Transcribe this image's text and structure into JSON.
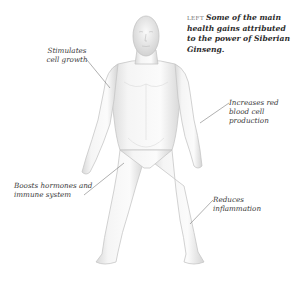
{
  "caption": {
    "lead": "LEFT",
    "text": "Some of the main health gains attributed to the power of Siberian Ginseng."
  },
  "annotations": [
    {
      "id": "growth",
      "text": "Stimulates cell growth"
    },
    {
      "id": "blood",
      "text": "Increases red blood cell production"
    },
    {
      "id": "hormones",
      "text": "Boosts hormones and immune system"
    },
    {
      "id": "inflammation",
      "text": "Reduces inflammation"
    }
  ],
  "illustration": {
    "subject": "white 3D male human figure, front view, standing",
    "colors": {
      "body": "#f4f4f4",
      "shadow": "#c8c8c8",
      "leader_line": "#7a7a7a"
    }
  }
}
